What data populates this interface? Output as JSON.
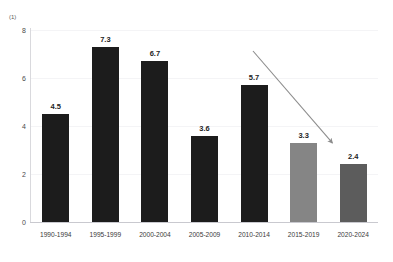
{
  "chart_data": {
    "type": "bar",
    "title": "",
    "xlabel": "",
    "ylabel": "",
    "unit_label": "(1)",
    "categories": [
      "1990-1994",
      "1995-1999",
      "2000-2004",
      "2005-2009",
      "2010-2014",
      "2015-2019",
      "2020-2024"
    ],
    "values": [
      4.5,
      7.3,
      6.7,
      3.6,
      5.7,
      3.3,
      2.4
    ],
    "value_labels": [
      "4.5",
      "7.3",
      "6.7",
      "3.6",
      "5.7",
      "3.3",
      "2.4"
    ],
    "bar_colors": [
      "#1c1c1c",
      "#1c1c1c",
      "#1c1c1c",
      "#1c1c1c",
      "#1c1c1c",
      "#858585",
      "#5c5c5c"
    ],
    "ylim": [
      0,
      8
    ],
    "yticks": [
      0,
      2,
      4,
      6,
      8
    ],
    "ytick_labels": [
      "0",
      "2",
      "4",
      "6",
      "8"
    ],
    "grid": true,
    "legend": "none",
    "annotations": [
      {
        "name": "declining-trend-arrow",
        "kind": "arrow",
        "from": [
          253,
          51
        ],
        "to": [
          335,
          146
        ],
        "color": "#8c8c8c"
      }
    ]
  },
  "axes": {
    "unit": "(1)"
  }
}
